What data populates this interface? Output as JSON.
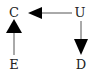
{
  "diagram": {
    "nodes": [
      {
        "id": "C",
        "label": "C",
        "x": 14,
        "y": 13
      },
      {
        "id": "U",
        "label": "U",
        "x": 80,
        "y": 13
      },
      {
        "id": "E",
        "label": "E",
        "x": 14,
        "y": 64
      },
      {
        "id": "D",
        "label": "D",
        "x": 81,
        "y": 64
      }
    ],
    "edges": [
      {
        "from": "U",
        "to": "C"
      },
      {
        "from": "E",
        "to": "C"
      },
      {
        "from": "U",
        "to": "D"
      }
    ],
    "colors": {
      "stroke": "#555555",
      "arrowhead": "#000000",
      "text": "#222222"
    }
  }
}
